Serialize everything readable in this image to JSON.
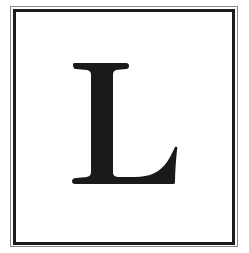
{
  "card": {
    "letter": "L",
    "frame_outer_color": "#8a8a8a",
    "frame_inner_color": "#1c1c1c",
    "letter_color": "#1a1a1a",
    "background_color": "#ffffff"
  }
}
